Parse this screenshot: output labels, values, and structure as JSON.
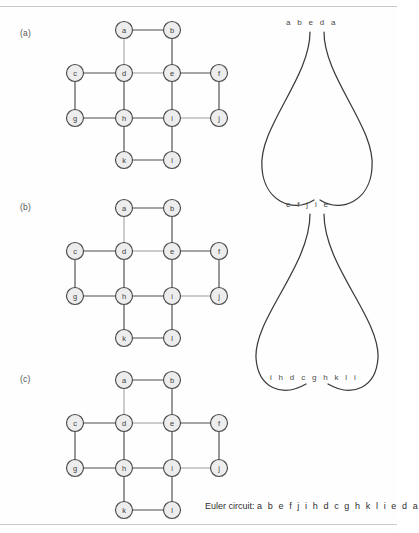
{
  "figure": {
    "panels": [
      {
        "label": "(a)",
        "top": 18
      },
      {
        "label": "(b)",
        "top": 196
      },
      {
        "label": "(c)",
        "top": 368
      }
    ]
  },
  "graph": {
    "nodes": [
      {
        "id": "a",
        "label": "a",
        "x": 74,
        "y": 12
      },
      {
        "id": "b",
        "label": "b",
        "x": 122,
        "y": 12
      },
      {
        "id": "c",
        "label": "c",
        "x": 25,
        "y": 55
      },
      {
        "id": "d",
        "label": "d",
        "x": 74,
        "y": 55
      },
      {
        "id": "e",
        "label": "e",
        "x": 122,
        "y": 55
      },
      {
        "id": "f",
        "label": "f",
        "x": 169,
        "y": 55
      },
      {
        "id": "g",
        "label": "g",
        "x": 25,
        "y": 100
      },
      {
        "id": "h",
        "label": "h",
        "x": 74,
        "y": 100
      },
      {
        "id": "i",
        "label": "i",
        "x": 122,
        "y": 100
      },
      {
        "id": "j",
        "label": "j",
        "x": 169,
        "y": 100
      },
      {
        "id": "k",
        "label": "k",
        "x": 74,
        "y": 142
      },
      {
        "id": "l",
        "label": "l",
        "x": 122,
        "y": 142
      }
    ],
    "edges": [
      {
        "from": "a",
        "to": "b",
        "weight": "normal"
      },
      {
        "from": "a",
        "to": "d",
        "weight": "light"
      },
      {
        "from": "b",
        "to": "e",
        "weight": "normal"
      },
      {
        "from": "c",
        "to": "d",
        "weight": "normal"
      },
      {
        "from": "c",
        "to": "g",
        "weight": "normal"
      },
      {
        "from": "d",
        "to": "e",
        "weight": "light"
      },
      {
        "from": "d",
        "to": "h",
        "weight": "normal"
      },
      {
        "from": "e",
        "to": "f",
        "weight": "normal"
      },
      {
        "from": "e",
        "to": "i",
        "weight": "normal"
      },
      {
        "from": "f",
        "to": "j",
        "weight": "normal"
      },
      {
        "from": "g",
        "to": "h",
        "weight": "normal"
      },
      {
        "from": "h",
        "to": "i",
        "weight": "normal"
      },
      {
        "from": "h",
        "to": "k",
        "weight": "normal"
      },
      {
        "from": "i",
        "to": "j",
        "weight": "light"
      },
      {
        "from": "i",
        "to": "l",
        "weight": "normal"
      },
      {
        "from": "k",
        "to": "l",
        "weight": "normal"
      }
    ],
    "node_radius": 8.5
  },
  "loops": {
    "sequences": [
      {
        "id": "top",
        "text": "a b e d a",
        "left": 38,
        "top": 0
      },
      {
        "id": "middle",
        "text": "e f j i e",
        "left": 38,
        "top": 182
      },
      {
        "id": "bottom",
        "text": "i h d c g h k l i",
        "left": 22,
        "top": 355
      }
    ],
    "loop_paths": [
      {
        "id": "upper-loop-left",
        "d": "M 62 14 C 62 60 10 110 14 150 C 16 182 44 196 66 182"
      },
      {
        "id": "upper-loop-right",
        "d": "M 76 14 C 76 60 128 110 124 150 C 122 182 94 196 72 182"
      },
      {
        "id": "lower-loop-left",
        "d": "M 62 196 C 62 248 6 300 8 340 C 10 370 34 380 58 366"
      },
      {
        "id": "lower-loop-right",
        "d": "M 76 196 C 76 248 132 300 130 340 C 128 370 104 380 80 366"
      }
    ]
  },
  "caption": {
    "prefix": "Euler circuit:",
    "sequence": "a b e f j i h d c g h k l i e d a"
  }
}
